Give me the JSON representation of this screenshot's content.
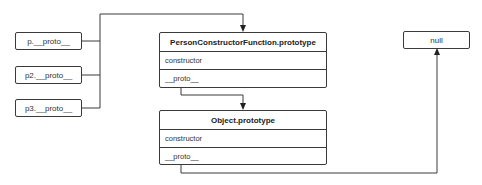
{
  "instances": [
    {
      "label": "p.__proto__"
    },
    {
      "label": "p2.__proto__"
    },
    {
      "label": "p3.__proto__"
    }
  ],
  "person_prototype": {
    "title": "PersonConstructorFunction.prototype",
    "fields": [
      "constructor",
      "__proto__"
    ]
  },
  "object_prototype": {
    "title": "Object.prototype",
    "fields": [
      "constructor",
      "__proto__"
    ]
  },
  "null_node": {
    "label": "null"
  },
  "colors": {
    "stroke": "#3a3a3a",
    "background": "#ffffff"
  }
}
